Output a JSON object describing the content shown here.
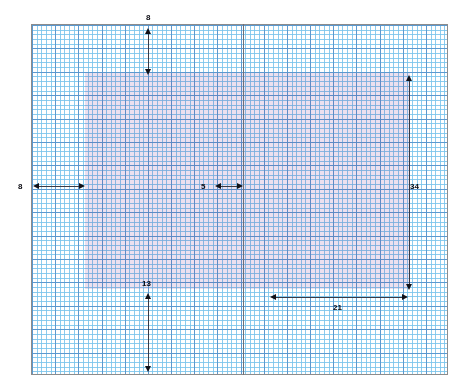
{
  "figure": {
    "kind": "graph-paper-dimension-diagram",
    "background_color": "#ffffff",
    "title": ""
  },
  "grid": {
    "border_color": "#8c8c8c",
    "minor_color": "#78c3eb",
    "major_color": "#5a96cd",
    "minor_cells_x": 90,
    "minor_cells_y": 75,
    "cells_per_major": 5,
    "left": 31,
    "top": 24,
    "width": 417,
    "height": 351
  },
  "overlay_region": {
    "name": "shaded-rectangle",
    "fill_color": "#d696be",
    "left": 85,
    "top": 73,
    "width": 325,
    "height": 216
  },
  "divider": {
    "name": "vertical-divider",
    "color": "#6d6f78",
    "x": 243
  },
  "dimensions": [
    {
      "id": "top-gap",
      "label": "8",
      "orientation": "vertical",
      "label_x": 146,
      "label_y": 13,
      "line_x": 148,
      "y1": 28,
      "y2": 75
    },
    {
      "id": "left-gap",
      "label": "8",
      "orientation": "horizontal",
      "label_x": 18,
      "label_y": 182,
      "line_y": 186,
      "x1": 33,
      "x2": 85
    },
    {
      "id": "inner-gap",
      "label": "5",
      "orientation": "horizontal",
      "label_x": 201,
      "label_y": 182,
      "line_y": 186,
      "x1": 215,
      "x2": 243
    },
    {
      "id": "right-height",
      "label": "34",
      "orientation": "vertical",
      "label_x": 410,
      "label_y": 182,
      "line_x": 409,
      "y1": 75,
      "y2": 290
    },
    {
      "id": "bottom-gap",
      "label": "13",
      "orientation": "vertical",
      "label_x": 142,
      "label_y": 279,
      "line_x": 148,
      "y1": 293,
      "y2": 372
    },
    {
      "id": "bottom-width",
      "label": "21",
      "orientation": "horizontal",
      "label_x": 333,
      "label_y": 303,
      "line_y": 297,
      "x1": 270,
      "x2": 408
    }
  ],
  "chart_data": {
    "type": "table",
    "xlabel": "",
    "ylabel": "",
    "categories": [
      "top-gap",
      "left-gap",
      "inner-gap",
      "right-height",
      "bottom-gap",
      "bottom-width"
    ],
    "values": [
      8,
      8,
      5,
      34,
      13,
      21
    ],
    "annotations": [
      "8",
      "8",
      "5",
      "34",
      "13",
      "21"
    ],
    "grid": true,
    "legend": "none"
  }
}
